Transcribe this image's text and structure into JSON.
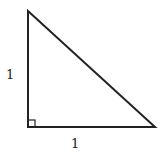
{
  "diagram": {
    "type": "right-triangle",
    "vertices": {
      "top": [
        28,
        11
      ],
      "right_angle": [
        28,
        127
      ],
      "right": [
        155,
        127
      ]
    },
    "labels": {
      "vertical_leg": "1",
      "horizontal_leg": "1"
    },
    "right_angle_marker": true,
    "stroke_color": "#222222"
  }
}
